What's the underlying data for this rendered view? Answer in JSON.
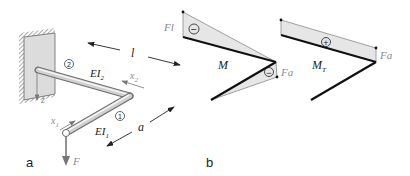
{
  "panels": [
    {
      "id": "a",
      "label": "a"
    },
    {
      "id": "b",
      "label": "b"
    }
  ],
  "figure_a": {
    "segment_2": {
      "marker": "2",
      "stiffness_label": "EI",
      "stiffness_sub": "2",
      "coord_label": "x",
      "coord_sub": "2"
    },
    "segment_1": {
      "marker": "1",
      "stiffness_label": "EI",
      "stiffness_sub": "1",
      "coord_label": "x",
      "coord_sub": "1"
    },
    "length_l": "l",
    "length_a": "a",
    "axis_z": "z",
    "force": "F"
  },
  "figure_b": {
    "bending": {
      "title": "M",
      "sign": "−",
      "value_root": "Fl",
      "value_corner": "Fa",
      "corner_sign": "−"
    },
    "torsion": {
      "title": "M",
      "title_sub": "T",
      "sign": "+",
      "value": "Fa"
    }
  },
  "colors": {
    "fill": "#e6e6e6",
    "line": "#111111",
    "outline": "#8a8a8a",
    "beam": "#bdbdbd"
  }
}
